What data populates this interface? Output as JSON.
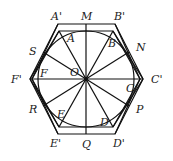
{
  "diagram": {
    "center": {
      "name": "O",
      "x": 86,
      "y": 79
    },
    "circle": {
      "cx": 86,
      "cy": 79,
      "r": 48
    },
    "outer_hexagon": [
      {
        "name": "A'",
        "x": 58,
        "y": 24
      },
      {
        "name": "B'",
        "x": 115,
        "y": 24
      },
      {
        "name": "C'",
        "x": 143,
        "y": 79
      },
      {
        "name": "D'",
        "x": 115,
        "y": 134
      },
      {
        "name": "E'",
        "x": 58,
        "y": 134
      },
      {
        "name": "F'",
        "x": 30,
        "y": 79
      }
    ],
    "inner_hexagon": [
      {
        "name": "A",
        "x": 59,
        "y": 31
      },
      {
        "name": "B",
        "x": 113,
        "y": 31
      },
      {
        "name": "C",
        "x": 140,
        "y": 79
      },
      {
        "name": "D",
        "x": 113,
        "y": 127
      },
      {
        "name": "E",
        "x": 59,
        "y": 127
      },
      {
        "name": "F",
        "x": 32,
        "y": 79
      }
    ],
    "tangent_points": [
      {
        "name": "M",
        "x": 86,
        "y": 24
      },
      {
        "name": "N",
        "x": 129,
        "y": 52
      },
      {
        "name": "P",
        "x": 129,
        "y": 106
      },
      {
        "name": "Q",
        "x": 86,
        "y": 134
      },
      {
        "name": "R",
        "x": 43,
        "y": 106
      },
      {
        "name": "S",
        "x": 43,
        "y": 52
      }
    ],
    "labels": {
      "A_prime": "A'",
      "B_prime": "B'",
      "C_prime": "C'",
      "D_prime": "D'",
      "E_prime": "E'",
      "F_prime": "F'",
      "A": "A",
      "B": "B",
      "C": "C",
      "D": "D",
      "E": "E",
      "F": "F",
      "M": "M",
      "N": "N",
      "P": "P",
      "Q": "Q",
      "R": "R",
      "S": "S",
      "O": "O"
    }
  }
}
